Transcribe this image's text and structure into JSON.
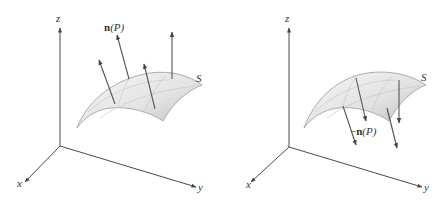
{
  "figure": {
    "panels": [
      {
        "id": "left",
        "axes": {
          "x_label": "x",
          "y_label": "y",
          "z_label": "z"
        },
        "surface_label": "S",
        "normal_label": {
          "prefix": "",
          "bold": "n",
          "arg": "(P)"
        },
        "normal_direction": "outward/upward"
      },
      {
        "id": "right",
        "axes": {
          "x_label": "x",
          "y_label": "y",
          "z_label": "z"
        },
        "surface_label": "S",
        "normal_label": {
          "prefix": "−",
          "bold": "n",
          "arg": "(P)"
        },
        "normal_direction": "inward/downward"
      }
    ],
    "colors": {
      "axis": "#4a4a4a",
      "vector": "#555555",
      "surface_fill_light": "#f2f2f2",
      "surface_fill_dark": "#c8c8c8",
      "label": "#333333"
    }
  }
}
